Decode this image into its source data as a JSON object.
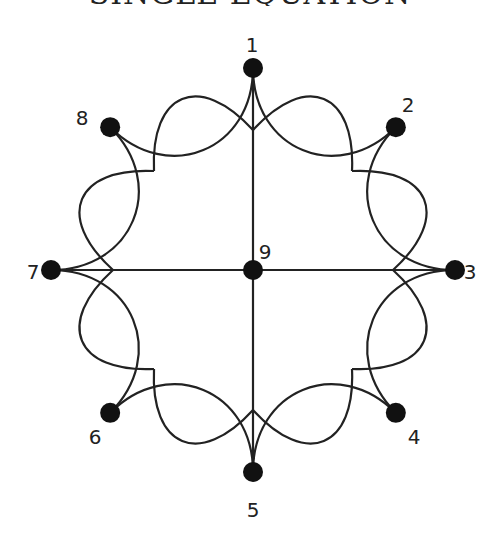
{
  "title": {
    "text": "SINGLE EQUATION",
    "clipped": true
  },
  "graph": {
    "center": [
      253,
      270
    ],
    "node_radius": 202,
    "cusp_radius": 140,
    "dot_radius": 10,
    "stroke_color": "#222222",
    "dot_color": "#111111",
    "nodes": [
      {
        "id": "1",
        "label": "1",
        "angle": 90,
        "label_pos": [
          252,
          52
        ]
      },
      {
        "id": "2",
        "label": "2",
        "angle": 45,
        "label_pos": [
          408,
          112
        ]
      },
      {
        "id": "3",
        "label": "3",
        "angle": 0,
        "label_pos": [
          470,
          279
        ]
      },
      {
        "id": "4",
        "label": "4",
        "angle": -45,
        "label_pos": [
          414,
          444
        ]
      },
      {
        "id": "5",
        "label": "5",
        "angle": -90,
        "label_pos": [
          253,
          517
        ]
      },
      {
        "id": "6",
        "label": "6",
        "angle": -135,
        "label_pos": [
          95,
          444
        ]
      },
      {
        "id": "7",
        "label": "7",
        "angle": 180,
        "label_pos": [
          33,
          279
        ]
      },
      {
        "id": "8",
        "label": "8",
        "angle": 135,
        "label_pos": [
          82,
          125
        ]
      }
    ],
    "center_node": {
      "id": "9",
      "label": "9",
      "label_pos": [
        265,
        259
      ]
    },
    "spokes": [
      [
        "1",
        "5"
      ],
      [
        "7",
        "3"
      ]
    ]
  }
}
